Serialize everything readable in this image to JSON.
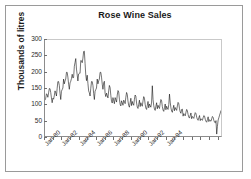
{
  "chart_data": {
    "type": "line",
    "title": "Rose Wine Sales",
    "xlabel": "",
    "ylabel": "Thousands of litres",
    "ylim": [
      0,
      300
    ],
    "yticks": [
      0,
      50,
      100,
      150,
      200,
      250,
      300
    ],
    "ytick_labels": [
      "0",
      "50",
      "100",
      "150",
      "200",
      "250",
      "300"
    ],
    "xtick_labels": [
      "Jan-80",
      "Jan-82",
      "Jan-84",
      "Jan-86",
      "Jan-88",
      "Jan-90",
      "Jan-92",
      "Jan-94"
    ],
    "grid": false,
    "legend": false,
    "x_start": "Jan-80",
    "x_end": "Jul-95",
    "x_frequency": "monthly",
    "series": [
      {
        "name": "Rose Wine Sales",
        "color": "#000000",
        "values": [
          112,
          118,
          132,
          129,
          121,
          135,
          148,
          148,
          136,
          119,
          104,
          118,
          115,
          126,
          141,
          135,
          125,
          149,
          170,
          170,
          158,
          133,
          114,
          140,
          145,
          150,
          178,
          163,
          172,
          178,
          199,
          199,
          184,
          162,
          146,
          166,
          171,
          180,
          193,
          181,
          183,
          218,
          230,
          242,
          209,
          191,
          172,
          194,
          196,
          196,
          236,
          235,
          229,
          243,
          264,
          265,
          227,
          191,
          173,
          190,
          164,
          141,
          135,
          125,
          149,
          170,
          170,
          158,
          133,
          114,
          140,
          145,
          150,
          178,
          163,
          172,
          178,
          199,
          199,
          184,
          162,
          146,
          166,
          171,
          133,
          123,
          134,
          126,
          119,
          141,
          158,
          151,
          127,
          108,
          103,
          120,
          110,
          101,
          120,
          113,
          106,
          128,
          142,
          138,
          115,
          99,
          94,
          110,
          104,
          96,
          112,
          108,
          101,
          121,
          136,
          130,
          109,
          95,
          90,
          104,
          118,
          95,
          108,
          100,
          96,
          115,
          128,
          124,
          103,
          90,
          86,
          99,
          112,
          92,
          104,
          97,
          93,
          110,
          123,
          118,
          99,
          87,
          83,
          96,
          108,
          88,
          100,
          94,
          90,
          106,
          157,
          114,
          95,
          84,
          80,
          93,
          104,
          85,
          96,
          90,
          86,
          102,
          114,
          110,
          92,
          81,
          77,
          89,
          100,
          82,
          93,
          87,
          83,
          98,
          131,
          106,
          88,
          78,
          74,
          86,
          96,
          79,
          89,
          84,
          80,
          94,
          105,
          101,
          85,
          75,
          71,
          83,
          84,
          62,
          70,
          66,
          63,
          74,
          83,
          79,
          67,
          59,
          56,
          65,
          72,
          54,
          61,
          58,
          55,
          65,
          73,
          70,
          59,
          52,
          49,
          57,
          64,
          48,
          54,
          51,
          49,
          57,
          64,
          62,
          52,
          46,
          43,
          51,
          60,
          45,
          51,
          48,
          46,
          54,
          61,
          58,
          49,
          43,
          41,
          48,
          6,
          30,
          50,
          57,
          65,
          72,
          80
        ]
      }
    ]
  },
  "axes": {
    "ytick_marks": 7,
    "xtick_marks": 16
  }
}
